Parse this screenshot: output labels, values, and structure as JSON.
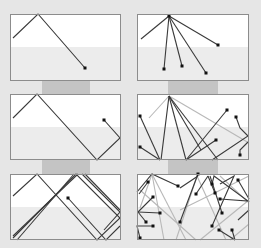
{
  "canvas": {
    "width": 261,
    "height": 248,
    "background": "#e6e6e6"
  },
  "colors": {
    "panel_top": "#ffffff",
    "panel_bottom": "#ececec",
    "panel_border": "#8c8c8c",
    "strip": "#c4c4c4",
    "line_dark": "#3a3a3a",
    "line_light": "#b8b8b8",
    "dot": "#111111"
  },
  "strips": [
    {
      "x": 42,
      "y": 81,
      "w": 48,
      "h": 13
    },
    {
      "x": 168,
      "y": 81,
      "w": 50,
      "h": 13
    },
    {
      "x": 42,
      "y": 160,
      "w": 48,
      "h": 14
    },
    {
      "x": 168,
      "y": 160,
      "w": 50,
      "h": 14
    }
  ],
  "panels": [
    {
      "id": "single-bounce-1",
      "x": 10,
      "y": 14,
      "w": 111,
      "h": 67,
      "split": 33,
      "light_lines": [],
      "dark_lines": [
        [
          [
            13,
            38
          ],
          [
            38,
            14
          ],
          [
            85,
            68
          ]
        ]
      ],
      "dots": [
        [
          85,
          68
        ]
      ]
    },
    {
      "id": "fan-1",
      "x": 137,
      "y": 14,
      "w": 112,
      "h": 67,
      "split": 33,
      "light_lines": [],
      "dark_lines": [
        [
          [
            141,
            39
          ],
          [
            169,
            16
          ]
        ],
        [
          [
            169,
            16
          ],
          [
            218,
            45
          ]
        ],
        [
          [
            169,
            16
          ],
          [
            164,
            69
          ]
        ],
        [
          [
            169,
            16
          ],
          [
            182,
            66
          ]
        ],
        [
          [
            169,
            16
          ],
          [
            206,
            73
          ]
        ]
      ],
      "dots": [
        [
          169,
          16
        ],
        [
          218,
          45
        ],
        [
          164,
          69
        ],
        [
          182,
          66
        ],
        [
          206,
          73
        ]
      ]
    },
    {
      "id": "single-bounce-2",
      "x": 10,
      "y": 94,
      "w": 111,
      "h": 66,
      "split": 33,
      "light_lines": [],
      "dark_lines": [
        [
          [
            13,
            118
          ],
          [
            37,
            94
          ],
          [
            97,
            160
          ],
          [
            120,
            138
          ],
          [
            104,
            120
          ]
        ]
      ],
      "dots": [
        [
          104,
          120
        ]
      ]
    },
    {
      "id": "fan-2",
      "x": 137,
      "y": 94,
      "w": 112,
      "h": 66,
      "split": 33,
      "light_lines": [
        [
          [
            169,
            96
          ],
          [
            149,
            118
          ]
        ],
        [
          [
            169,
            96
          ],
          [
            249,
            143
          ]
        ]
      ],
      "dark_lines": [
        [
          [
            169,
            96
          ],
          [
            161,
            160
          ]
        ],
        [
          [
            169,
            96
          ],
          [
            186,
            160
          ]
        ],
        [
          [
            169,
            96
          ],
          [
            218,
            160
          ]
        ],
        [
          [
            169,
            96
          ],
          [
            201,
            150
          ]
        ],
        [
          [
            140,
            116
          ],
          [
            160,
            160
          ]
        ],
        [
          [
            140,
            147
          ],
          [
            160,
            160
          ]
        ],
        [
          [
            186,
            160
          ],
          [
            227,
            110
          ]
        ],
        [
          [
            186,
            160
          ],
          [
            216,
            140
          ]
        ],
        [
          [
            212,
            160
          ],
          [
            248,
            136
          ],
          [
            240,
            128
          ],
          [
            236,
            117
          ]
        ],
        [
          [
            248,
            142
          ],
          [
            240,
            150
          ],
          [
            240,
            155
          ]
        ]
      ],
      "dots": [
        [
          140,
          116
        ],
        [
          140,
          147
        ],
        [
          227,
          110
        ],
        [
          216,
          140
        ],
        [
          236,
          117
        ],
        [
          240,
          155
        ]
      ]
    },
    {
      "id": "single-bounce-3",
      "x": 10,
      "y": 174,
      "w": 111,
      "h": 66,
      "split": 33,
      "light_lines": [],
      "dark_lines": [
        [
          [
            13,
            196
          ],
          [
            37,
            174
          ],
          [
            97,
            240
          ],
          [
            120,
            218
          ],
          [
            76,
            174
          ],
          [
            13,
            238
          ]
        ],
        [
          [
            78,
            174
          ],
          [
            13,
            236
          ]
        ],
        [
          [
            82,
            174
          ],
          [
            120,
            212
          ],
          [
            104,
            230
          ]
        ],
        [
          [
            68,
            198
          ],
          [
            106,
            240
          ],
          [
            120,
            226
          ]
        ],
        [
          [
            85,
            174
          ],
          [
            120,
            210
          ]
        ],
        [
          [
            17,
            240
          ],
          [
            74,
            174
          ]
        ]
      ],
      "dots": [
        [
          68,
          198
        ]
      ]
    },
    {
      "id": "fan-3",
      "x": 137,
      "y": 174,
      "w": 112,
      "h": 66,
      "split": 33,
      "light_lines": [
        [
          [
            152,
            174
          ],
          [
            164,
            240
          ]
        ],
        [
          [
            152,
            174
          ],
          [
            186,
            240
          ]
        ],
        [
          [
            152,
            174
          ],
          [
            140,
            208
          ]
        ],
        [
          [
            197,
            176
          ],
          [
            176,
            240
          ]
        ],
        [
          [
            197,
            176
          ],
          [
            226,
            240
          ]
        ],
        [
          [
            140,
            190
          ],
          [
            196,
            240
          ]
        ],
        [
          [
            220,
            176
          ],
          [
            248,
            202
          ]
        ],
        [
          [
            249,
            200
          ],
          [
            200,
            240
          ]
        ],
        [
          [
            249,
            224
          ],
          [
            230,
            240
          ]
        ],
        [
          [
            180,
            210
          ],
          [
            249,
            176
          ]
        ]
      ],
      "dark_lines": [
        [
          [
            137,
            192
          ],
          [
            152,
            174
          ],
          [
            178,
            186
          ]
        ],
        [
          [
            148,
            182
          ],
          [
            139,
            194
          ]
        ],
        [
          [
            153,
            197
          ],
          [
            138,
            212
          ]
        ],
        [
          [
            160,
            213
          ],
          [
            138,
            212
          ]
        ],
        [
          [
            146,
            222
          ],
          [
            138,
            212
          ]
        ],
        [
          [
            153,
            226
          ],
          [
            137,
            226
          ],
          [
            140,
            238
          ]
        ],
        [
          [
            198,
            174
          ],
          [
            180,
            222
          ]
        ],
        [
          [
            180,
            188
          ],
          [
            198,
            176
          ]
        ],
        [
          [
            208,
            176
          ],
          [
            215,
            193
          ]
        ],
        [
          [
            212,
            184
          ],
          [
            214,
            176
          ],
          [
            248,
            201
          ],
          [
            220,
            199
          ]
        ],
        [
          [
            208,
            176
          ],
          [
            196,
            194
          ]
        ],
        [
          [
            220,
            184
          ],
          [
            234,
            176
          ],
          [
            212,
            226
          ]
        ],
        [
          [
            210,
            176
          ],
          [
            222,
            213
          ]
        ],
        [
          [
            238,
            180
          ],
          [
            249,
            199
          ]
        ],
        [
          [
            219,
            230
          ],
          [
            235,
            240
          ]
        ],
        [
          [
            232,
            230
          ],
          [
            235,
            240
          ]
        ],
        [
          [
            249,
            210
          ],
          [
            238,
            220
          ]
        ]
      ],
      "dots": [
        [
          148,
          182
        ],
        [
          153,
          197
        ],
        [
          160,
          213
        ],
        [
          146,
          222
        ],
        [
          153,
          226
        ],
        [
          140,
          238
        ],
        [
          178,
          186
        ],
        [
          180,
          222
        ],
        [
          196,
          194
        ],
        [
          215,
          193
        ],
        [
          220,
          199
        ],
        [
          212,
          226
        ],
        [
          222,
          213
        ],
        [
          238,
          180
        ],
        [
          219,
          230
        ],
        [
          232,
          230
        ],
        [
          198,
          174
        ],
        [
          212,
          184
        ]
      ]
    }
  ]
}
